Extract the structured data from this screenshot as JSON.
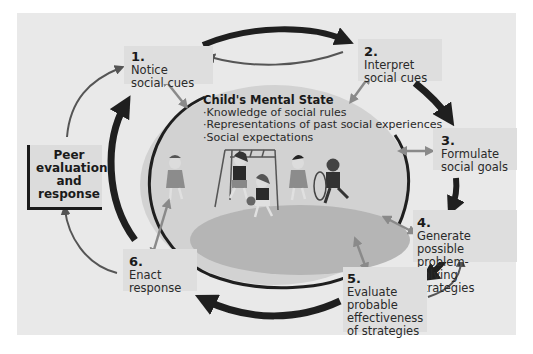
{
  "figure": {
    "center": {
      "title": "Child's Mental State",
      "items": [
        "Knowledge of social rules",
        "Representations of past social experiences",
        "Social expectations"
      ]
    },
    "steps": [
      {
        "number": "1.",
        "text": "Notice\nsocial cues"
      },
      {
        "number": "2.",
        "text": "Interpret\nsocial cues"
      },
      {
        "number": "3.",
        "text": "Formulate\nsocial goals"
      },
      {
        "number": "4.",
        "text": "Generate\npossible problem-\nsolving strategies"
      },
      {
        "number": "5.",
        "text": "Evaluate\nprobable\neffectiveness\nof strategies"
      },
      {
        "number": "6.",
        "text": "Enact\nresponse"
      }
    ],
    "feedback": {
      "label": "Peer\nevaluation\nand\nresponse"
    },
    "colors": {
      "background": "#e9e9e9",
      "step_box": "#dedede",
      "ellipse_fill": "#d2d2d2",
      "ground": "#b5b5b5",
      "main_arrow": "#1f1f1f",
      "link_arrow": "#8a8a8a",
      "feedback_arrow": "#555555"
    }
  }
}
